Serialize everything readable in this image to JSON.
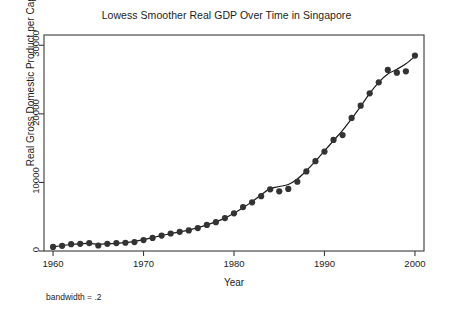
{
  "chart_data": {
    "type": "scatter",
    "title": "Lowess Smoother Real GDP Over Time in Singapore",
    "xlabel": "Year",
    "ylabel": "Real Gross Domestic Product per Capita",
    "annotation": "bandwidth = .2",
    "grid": false,
    "legend": "none",
    "xlim": [
      1959,
      2001
    ],
    "ylim": [
      0,
      31500
    ],
    "xticks": [
      1960,
      1970,
      1980,
      1990,
      2000
    ],
    "xtick_labels": [
      "1960",
      "1970",
      "1980",
      "1990",
      "2000"
    ],
    "yticks": [
      0,
      10000,
      20000,
      30000
    ],
    "ytick_labels": [
      "0",
      "10000",
      "20000",
      "30000"
    ],
    "marker_color": "#333333",
    "line_color": "#1a1a1a",
    "frame_color": "#3a3a3a",
    "x": [
      1960,
      1961,
      1962,
      1963,
      1964,
      1965,
      1966,
      1967,
      1968,
      1969,
      1970,
      1971,
      1972,
      1973,
      1974,
      1975,
      1976,
      1977,
      1978,
      1979,
      1980,
      1981,
      1982,
      1983,
      1984,
      1985,
      1986,
      1987,
      1988,
      1989,
      1990,
      1991,
      1992,
      1993,
      1994,
      1995,
      1996,
      1997,
      1998,
      1999,
      2000
    ],
    "series": [
      {
        "name": "Real GDP per Capita",
        "kind": "points",
        "values": [
          600,
          750,
          1000,
          1050,
          1150,
          800,
          1050,
          1150,
          1200,
          1300,
          1600,
          1900,
          2250,
          2550,
          2800,
          3000,
          3350,
          3800,
          4200,
          4800,
          5500,
          6400,
          7100,
          8000,
          9000,
          8700,
          9050,
          10100,
          11600,
          13100,
          14500,
          16200,
          16900,
          19400,
          21200,
          23000,
          24600,
          26400,
          26000,
          26200,
          28500
        ]
      },
      {
        "name": "Lowess smoother",
        "kind": "line",
        "values": [
          600,
          800,
          950,
          1050,
          1100,
          1000,
          1050,
          1120,
          1220,
          1400,
          1650,
          1950,
          2250,
          2520,
          2800,
          3050,
          3400,
          3800,
          4250,
          4800,
          5500,
          6300,
          7200,
          8200,
          9100,
          9400,
          9700,
          10500,
          11700,
          13100,
          14600,
          16100,
          17600,
          19300,
          21100,
          23000,
          24600,
          25800,
          26500,
          27300,
          28400
        ]
      }
    ]
  }
}
